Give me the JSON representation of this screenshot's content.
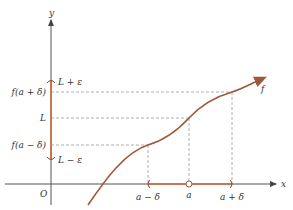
{
  "diagram": {
    "type": "epsilon-delta limit definition",
    "colors": {
      "axis": "#555555",
      "curve": "#a0583a",
      "interval": "#c87850",
      "guide": "#999999",
      "text": "#333333"
    },
    "axes": {
      "x_label": "x",
      "y_label": "y",
      "origin_label": "O"
    },
    "curve_label": "f",
    "y_labels": {
      "L_plus_eps": "L + ε",
      "f_a_plus_delta": "f(a + δ)",
      "L": "L",
      "f_a_minus_delta": "f(a − δ)",
      "L_minus_eps": "L − ε"
    },
    "x_labels": {
      "a_minus_delta": "a − δ",
      "a": "a",
      "a_plus_delta": "a + δ"
    }
  }
}
